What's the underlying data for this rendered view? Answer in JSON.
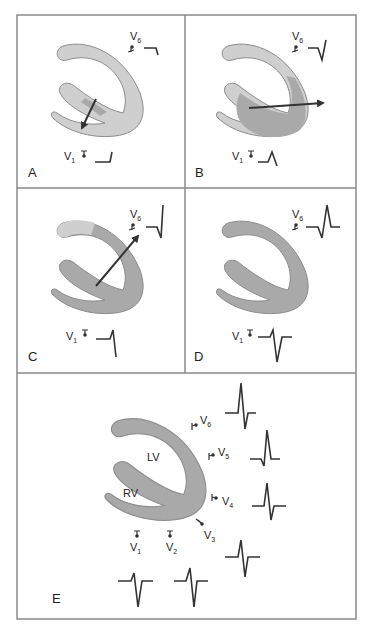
{
  "figure": {
    "colors": {
      "frame": "#8a8a8a",
      "tissue_light": "#cfcfcf",
      "tissue_dark": "#a9a9a9",
      "tissue_outline": "#8c8c8c",
      "vector": "#333333",
      "trace": "#333333"
    },
    "panels": [
      {
        "id": "A",
        "label": "A",
        "leads": [
          {
            "name": "V",
            "sub": "6"
          },
          {
            "name": "V",
            "sub": "1"
          }
        ]
      },
      {
        "id": "B",
        "label": "B",
        "leads": [
          {
            "name": "V",
            "sub": "6"
          },
          {
            "name": "V",
            "sub": "1"
          }
        ]
      },
      {
        "id": "C",
        "label": "C",
        "leads": [
          {
            "name": "V",
            "sub": "6"
          },
          {
            "name": "V",
            "sub": "1"
          }
        ]
      },
      {
        "id": "D",
        "label": "D",
        "leads": [
          {
            "name": "V",
            "sub": "6"
          },
          {
            "name": "V",
            "sub": "1"
          }
        ]
      },
      {
        "id": "E",
        "label": "E",
        "chambers": {
          "lv": "LV",
          "rv": "RV"
        },
        "leads": [
          {
            "name": "V",
            "sub": "1"
          },
          {
            "name": "V",
            "sub": "2"
          },
          {
            "name": "V",
            "sub": "3"
          },
          {
            "name": "V",
            "sub": "4"
          },
          {
            "name": "V",
            "sub": "5"
          },
          {
            "name": "V",
            "sub": "6"
          }
        ]
      }
    ]
  }
}
